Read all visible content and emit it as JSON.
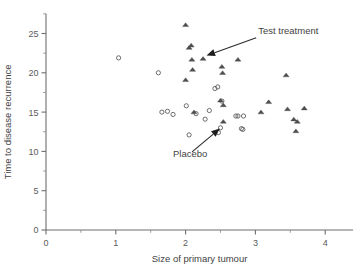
{
  "chart_data": {
    "type": "scatter",
    "title": "",
    "xlabel": "Size of primary tumour",
    "ylabel": "Time to disease recurrence",
    "xlim": [
      0,
      4.4
    ],
    "ylim": [
      0,
      27.5
    ],
    "xticks": [
      0,
      1,
      2,
      3,
      4
    ],
    "xticklabels": [
      "0",
      "1",
      "2",
      "3",
      "4"
    ],
    "xminorticks": [
      0.5,
      1.5,
      2.5,
      3.5
    ],
    "yticks": [
      0,
      5,
      10,
      15,
      20,
      25
    ],
    "yticklabels": [
      "0",
      "5",
      "10",
      "15",
      "20",
      "25"
    ],
    "yminorticks": [
      2.5,
      7.5,
      12.5,
      17.5,
      22.5,
      27.5
    ],
    "grid": false,
    "legend": "none",
    "series": [
      {
        "name": "Placebo",
        "marker": "circle",
        "points": [
          [
            1.04,
            21.9
          ],
          [
            1.61,
            20.0
          ],
          [
            1.66,
            15.0
          ],
          [
            1.74,
            15.1
          ],
          [
            1.82,
            14.7
          ],
          [
            2.01,
            15.8
          ],
          [
            2.05,
            12.1
          ],
          [
            2.15,
            14.8
          ],
          [
            2.28,
            14.1
          ],
          [
            2.34,
            15.2
          ],
          [
            2.42,
            18.0
          ],
          [
            2.46,
            18.2
          ],
          [
            2.47,
            12.4
          ],
          [
            2.5,
            13.0
          ],
          [
            2.52,
            16.4
          ],
          [
            2.72,
            14.5
          ],
          [
            2.75,
            14.5
          ],
          [
            2.8,
            12.9
          ],
          [
            2.82,
            12.8
          ],
          [
            2.83,
            14.5
          ]
        ]
      },
      {
        "name": "Test treatment",
        "marker": "triangle",
        "points": [
          [
            2.0,
            26.1
          ],
          [
            2.0,
            19.1
          ],
          [
            2.05,
            23.2
          ],
          [
            2.08,
            23.5
          ],
          [
            2.09,
            21.7
          ],
          [
            2.1,
            20.4
          ],
          [
            2.12,
            15.0
          ],
          [
            2.25,
            21.8
          ],
          [
            2.5,
            16.5
          ],
          [
            2.52,
            20.8
          ],
          [
            2.53,
            20.0
          ],
          [
            2.54,
            15.9
          ],
          [
            2.54,
            13.8
          ],
          [
            2.75,
            21.7
          ],
          [
            3.08,
            15.0
          ],
          [
            3.19,
            16.3
          ],
          [
            3.44,
            19.7
          ],
          [
            3.46,
            15.4
          ],
          [
            3.55,
            14.1
          ],
          [
            3.58,
            12.6
          ],
          [
            3.6,
            13.8
          ],
          [
            3.7,
            15.5
          ]
        ]
      }
    ],
    "annotations": [
      {
        "label": "Test treatment",
        "label_x": 3.04,
        "label_y": 24.9,
        "target_x": 2.3,
        "target_y": 22.2
      },
      {
        "label": "Placebo",
        "label_x": 1.82,
        "label_y": 9.3,
        "target_x": 2.49,
        "target_y": 12.9
      }
    ]
  }
}
